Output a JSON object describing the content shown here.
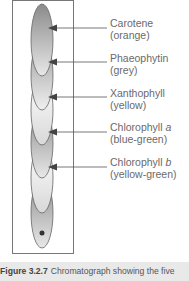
{
  "figure": {
    "title": "Chromatograph",
    "bands": [
      {
        "name": "Carotene",
        "color_label": "(orange)",
        "italic": ""
      },
      {
        "name": "Phaeophytin",
        "color_label": "(grey)",
        "italic": ""
      },
      {
        "name": "Xanthophyll",
        "color_label": "(yellow)",
        "italic": ""
      },
      {
        "name": "Chlorophyll ",
        "color_label": "(blue-green)",
        "italic": "a"
      },
      {
        "name": "Chlorophyll ",
        "color_label": "(yellow-green)",
        "italic": "b"
      }
    ],
    "caption": {
      "number": "Figure 3.2.7",
      "text": "Chromatograph showing the five"
    }
  }
}
